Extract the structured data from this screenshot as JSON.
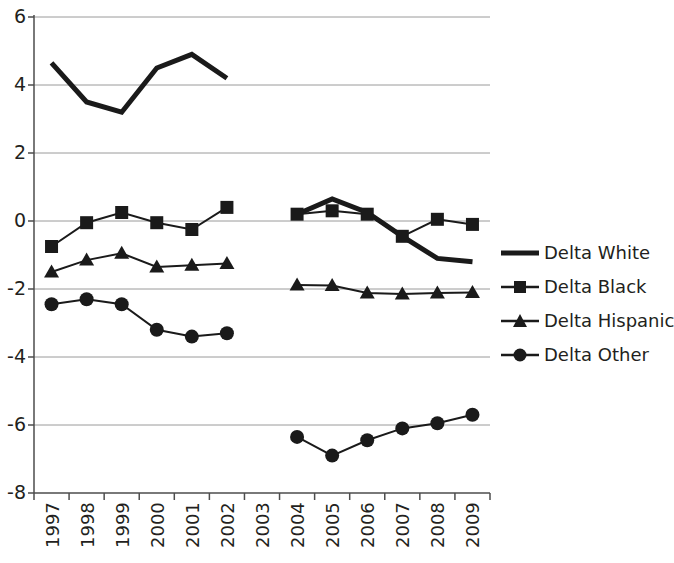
{
  "chart_data": {
    "type": "line",
    "title": "",
    "xlabel": "",
    "ylabel": "",
    "categories": [
      "1997",
      "1998",
      "1999",
      "2000",
      "2001",
      "2002",
      "2003",
      "2004",
      "2005",
      "2006",
      "2007",
      "2008",
      "2009"
    ],
    "ylim": [
      -8,
      6
    ],
    "ytick_labels": [
      "6",
      "4",
      "2",
      "0",
      "-2",
      "-4",
      "-6",
      "-8"
    ],
    "ytick_values": [
      6,
      4,
      2,
      0,
      -2,
      -4,
      -6,
      -8
    ],
    "grid": "horizontal",
    "legend_position": "right",
    "series": [
      {
        "name": "Delta White",
        "marker": "none",
        "color": "#1a1a1a",
        "line_width": 5,
        "values": [
          4.65,
          3.5,
          3.2,
          4.5,
          4.9,
          4.2,
          null,
          0.2,
          0.65,
          0.25,
          -0.45,
          -1.1,
          -1.2
        ]
      },
      {
        "name": "Delta Black",
        "marker": "square",
        "color": "#1a1a1a",
        "line_width": 2,
        "values": [
          -0.75,
          -0.05,
          0.25,
          -0.05,
          -0.25,
          0.4,
          null,
          0.2,
          0.3,
          0.2,
          -0.45,
          0.05,
          -0.1
        ]
      },
      {
        "name": "Delta Hispanic",
        "marker": "triangle",
        "color": "#1a1a1a",
        "line_width": 2,
        "values": [
          -1.5,
          -1.15,
          -0.95,
          -1.35,
          -1.3,
          -1.25,
          null,
          -1.88,
          -1.9,
          -2.12,
          -2.15,
          -2.12,
          -2.1
        ]
      },
      {
        "name": "Delta Other",
        "marker": "circle",
        "color": "#1a1a1a",
        "line_width": 2,
        "values": [
          -2.45,
          -2.3,
          -2.45,
          -3.2,
          -3.4,
          -3.3,
          null,
          -6.35,
          -6.9,
          -6.45,
          -6.1,
          -5.95,
          -5.7
        ]
      }
    ]
  },
  "legend": {
    "items": [
      {
        "label": "Delta White"
      },
      {
        "label": "Delta Black"
      },
      {
        "label": "Delta Hispanic"
      },
      {
        "label": "Delta Other"
      }
    ]
  }
}
